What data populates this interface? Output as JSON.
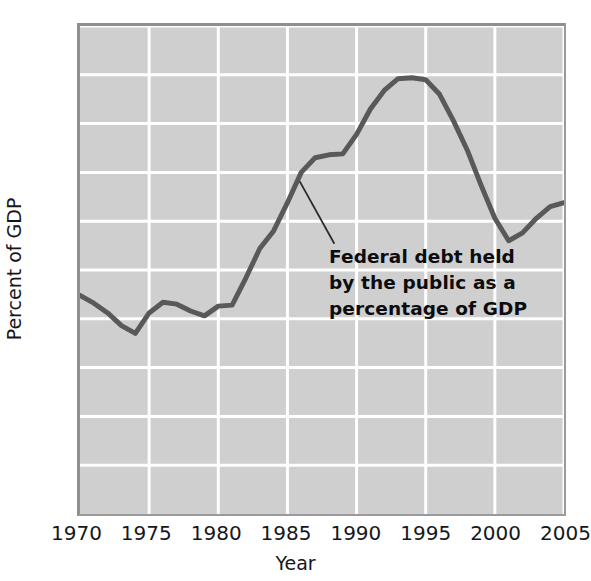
{
  "chart_data": {
    "type": "line",
    "title": "",
    "xlabel": "Year",
    "ylabel": "Percent of GDP",
    "xlim": [
      1970,
      2005
    ],
    "ylim": [
      0,
      50
    ],
    "grid": true,
    "legend": "none",
    "xticks": [
      "1970",
      "1975",
      "1980",
      "1985",
      "1990",
      "1995",
      "2000",
      "2005"
    ],
    "yticks": [
      "0",
      "5",
      "10",
      "15",
      "20",
      "25",
      "30",
      "35",
      "40",
      "45",
      "50"
    ],
    "series": [
      {
        "name": "Federal debt held by the public as a percentage of GDP",
        "color": "#595959",
        "x": [
          1970,
          1971,
          1972,
          1973,
          1974,
          1975,
          1976,
          1977,
          1978,
          1979,
          1980,
          1981,
          1982,
          1983,
          1984,
          1985,
          1986,
          1987,
          1988,
          1989,
          1990,
          1991,
          1992,
          1993,
          1994,
          1995,
          1996,
          1997,
          1998,
          1999,
          2000,
          2001,
          2002,
          2003,
          2004,
          2005
        ],
        "values": [
          22.4,
          21.6,
          20.6,
          19.3,
          18.5,
          20.6,
          21.7,
          21.5,
          20.8,
          20.3,
          21.3,
          21.4,
          24.2,
          27.2,
          29.0,
          31.9,
          35.0,
          36.5,
          36.8,
          36.9,
          38.9,
          41.5,
          43.4,
          44.6,
          44.7,
          44.5,
          43.0,
          40.3,
          37.3,
          33.7,
          30.3,
          28.0,
          28.8,
          30.3,
          31.5,
          31.9
        ]
      }
    ],
    "annotations": [
      {
        "text_lines": [
          "Federal debt held",
          "by the public as a",
          "percentage of GDP"
        ],
        "leader_from": {
          "x_px": 299,
          "y_px": 180
        },
        "leader_to": {
          "x_px": 334,
          "y_px": 243
        }
      }
    ]
  },
  "axes": {
    "y_axis_label": "Percent of GDP",
    "x_axis_label": "Year",
    "y_tick_labels": [
      "50",
      "45",
      "40",
      "35",
      "30",
      "25",
      "20",
      "15",
      "10",
      "5",
      "0"
    ],
    "x_tick_labels": [
      "1970",
      "1975",
      "1980",
      "1985",
      "1990",
      "1995",
      "2000",
      "2005"
    ]
  },
  "annotation": {
    "line1": "Federal debt held",
    "line2": "by the public as a",
    "line3": "percentage of GDP"
  },
  "colors": {
    "plot_background": "#cfcfcf",
    "gridline": "#ffffff",
    "line": "#595959",
    "text": "#17171a"
  }
}
